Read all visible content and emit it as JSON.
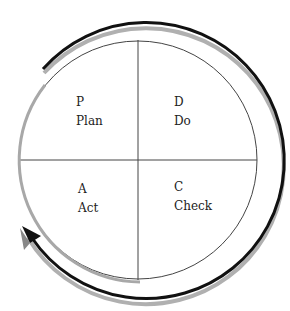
{
  "diagram": {
    "quadrants": [
      {
        "letter": "P",
        "word": "Plan"
      },
      {
        "letter": "D",
        "word": "Do"
      },
      {
        "letter": "C",
        "word": "Check"
      },
      {
        "letter": "A",
        "word": "Act"
      }
    ],
    "arrow_direction": "clockwise",
    "colors": {
      "lines": "#333333",
      "arrow": "#111111",
      "arrow_shadow": "#a0a0a0"
    }
  }
}
